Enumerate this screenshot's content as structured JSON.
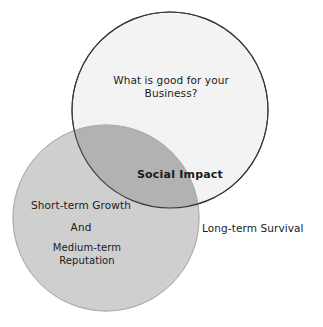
{
  "diagram": {
    "type": "venn-two-circle",
    "background_color": "#ffffff",
    "circles": [
      {
        "id": "business-circle",
        "name": "What is good for your Business",
        "cx": 170,
        "cy": 110,
        "r": 98,
        "fill_color": "#f3f3f3",
        "stroke_color": "#3a3a3a"
      },
      {
        "id": "growth-circle",
        "name": "Short-term Growth and Medium-term Reputation",
        "cx": 106,
        "cy": 218,
        "r": 93,
        "fill_color": "#cfcfcf",
        "stroke_color": "#b5b5b5"
      }
    ],
    "intersection": {
      "id": "social-impact-region",
      "fill_color": "#b2b2b2"
    }
  },
  "labels": {
    "business": "What is good for your\nBusiness?",
    "social_impact": "Social Impact",
    "growth": "Short-term Growth",
    "and": "And",
    "reputation": "Medium-term\nReputation",
    "survival": "Long-term Survival"
  }
}
